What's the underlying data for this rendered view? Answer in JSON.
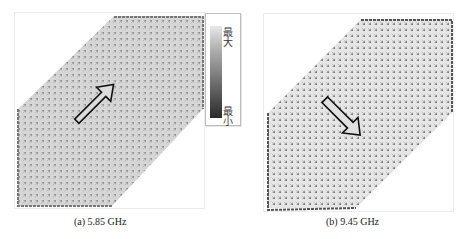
{
  "figure": {
    "panels": [
      {
        "id": "a",
        "caption": "(a) 5.85 GHz",
        "frequency": "5.85 GHz",
        "dominant_current_direction": "up-right (northeast)",
        "arrow_glyph": "hollow-arrow-northeast",
        "field_shade": "#8a8a8a"
      },
      {
        "id": "b",
        "caption": "(b) 9.45 GHz",
        "frequency": "9.45 GHz",
        "dominant_current_direction": "down-right (southeast)",
        "arrow_glyph": "hollow-arrow-southeast",
        "field_shade": "#4a4a4a"
      }
    ],
    "legend": {
      "max_label": "最大",
      "min_label": "最小",
      "gradient_top": "#e8e8e8",
      "gradient_bottom": "#2a2a2a"
    }
  }
}
